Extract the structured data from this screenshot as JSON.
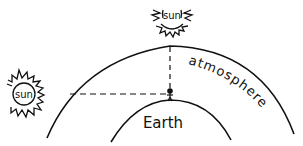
{
  "diagram": {
    "labels": {
      "sun_top": "sun",
      "sun_left": "sun",
      "earth": "Earth",
      "atmosphere": "atmosphere"
    },
    "colors": {
      "ink": "#111111",
      "background": "#ffffff"
    },
    "elements": [
      {
        "name": "sun-overhead",
        "label": "sun",
        "position": "top, directly above observer"
      },
      {
        "name": "sun-horizon",
        "label": "sun",
        "position": "left, at horizon"
      },
      {
        "name": "atmosphere-layer",
        "label": "atmosphere",
        "shape": "outer arc"
      },
      {
        "name": "earth-surface",
        "label": "Earth",
        "shape": "inner arc"
      },
      {
        "name": "observer",
        "shape": "stick figure on top of Earth"
      },
      {
        "name": "vertical-light-path",
        "style": "dashed",
        "meaning": "short path through atmosphere"
      },
      {
        "name": "horizontal-light-path",
        "style": "dashed",
        "meaning": "long path through atmosphere"
      }
    ]
  }
}
